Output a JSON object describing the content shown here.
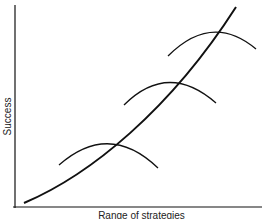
{
  "diagram": {
    "y_axis_label": "Success",
    "x_axis_label": "Range of strategies",
    "main_curve": {
      "description": "convex increasing curve",
      "from": [
        24,
        203
      ],
      "to": [
        236,
        7
      ]
    },
    "arcs": [
      {
        "name": "strategy-arc-1",
        "start": [
          59,
          165
        ],
        "peak": [
          110,
          143
        ],
        "end": [
          158,
          168
        ]
      },
      {
        "name": "strategy-arc-2",
        "start": [
          124,
          105
        ],
        "peak": [
          167,
          83
        ],
        "end": [
          216,
          103
        ]
      },
      {
        "name": "strategy-arc-3",
        "start": [
          168,
          56
        ],
        "peak": [
          213,
          34
        ],
        "end": [
          256,
          49
        ]
      }
    ],
    "colors": {
      "line": "#111111",
      "background": "#ffffff"
    }
  }
}
